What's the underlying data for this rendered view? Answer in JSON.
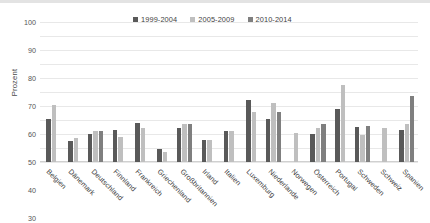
{
  "chart_data": {
    "type": "bar",
    "title": "",
    "xlabel": "",
    "ylabel": "Prozent",
    "ylim": [
      0,
      100
    ],
    "ytick_step": 10,
    "yticks": [
      100,
      90,
      80,
      70,
      60,
      50,
      40,
      30,
      20,
      10,
      0
    ],
    "grid": true,
    "legend_position": "top",
    "categories": [
      "Belgien",
      "Dänemark",
      "Deutschland",
      "Finnland",
      "Frankreich",
      "Griechenland",
      "Großbritannien",
      "Irland",
      "Italien",
      "Luxemburg",
      "Niederlande",
      "Norwegen",
      "Österreich",
      "Portugal",
      "Schweden",
      "Schweiz",
      "Spanien"
    ],
    "series": [
      {
        "name": "1999-2004",
        "color": "#595959",
        "values": [
          31,
          15,
          20,
          23,
          28,
          9,
          24,
          16,
          22,
          44,
          31,
          null,
          20,
          38,
          25,
          null,
          23
        ]
      },
      {
        "name": "2005-2009",
        "color": "#bfbfbf",
        "values": [
          41,
          17,
          22,
          18,
          24,
          7,
          27,
          16,
          22,
          36,
          42,
          21,
          24,
          55,
          19,
          24,
          27
        ]
      },
      {
        "name": "2010-2014",
        "color": "#7f7f7f",
        "values": [
          null,
          null,
          22,
          null,
          null,
          null,
          27,
          null,
          null,
          null,
          36,
          null,
          27,
          null,
          26,
          null,
          47
        ]
      }
    ]
  },
  "legend": {
    "items": [
      {
        "label": "1999-2004"
      },
      {
        "label": "2005-2009"
      },
      {
        "label": "2010-2014"
      }
    ]
  },
  "colors": {
    "series_1999_2004": "#595959",
    "series_2005_2009": "#bfbfbf",
    "series_2010_2014": "#7f7f7f",
    "gridline": "#e8e8e8",
    "text": "#3b3b3b",
    "background": "#ffffff"
  }
}
